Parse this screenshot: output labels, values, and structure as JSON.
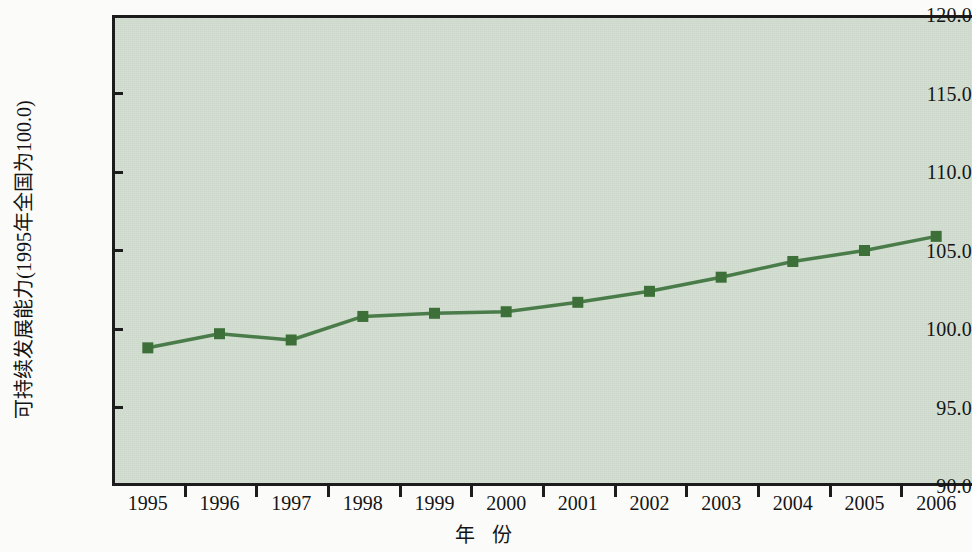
{
  "chart_data": {
    "type": "line",
    "title": "",
    "xlabel": "年 份",
    "ylabel": "可持续发展能力(1995年全国为100.0)",
    "categories": [
      "1995",
      "1996",
      "1997",
      "1998",
      "1999",
      "2000",
      "2001",
      "2002",
      "2003",
      "2004",
      "2005",
      "2006"
    ],
    "values": [
      98.8,
      99.7,
      99.3,
      100.8,
      101.0,
      101.1,
      101.7,
      102.4,
      103.3,
      104.3,
      105.0,
      105.9
    ],
    "series": [
      {
        "name": "可持续发展能力",
        "values": [
          98.8,
          99.7,
          99.3,
          100.8,
          101.0,
          101.1,
          101.7,
          102.4,
          103.3,
          104.3,
          105.0,
          105.9
        ]
      }
    ],
    "ylim": [
      90.0,
      120.0
    ],
    "y_ticks": [
      90.0,
      95.0,
      100.0,
      105.0,
      110.0,
      115.0,
      120.0
    ],
    "y_tick_labels": [
      "90.0",
      "95.0",
      "100.0",
      "105.0",
      "110.0",
      "115.0",
      "120.0"
    ],
    "grid": false,
    "legend": "none",
    "marker": "square",
    "colors": {
      "line": "#4a7c4a",
      "marker": "#3d7038",
      "plot_background": "#ccd8ca",
      "axis": "#1c1c1c",
      "text": "#141414",
      "page_background": "#fbfbfa"
    }
  }
}
